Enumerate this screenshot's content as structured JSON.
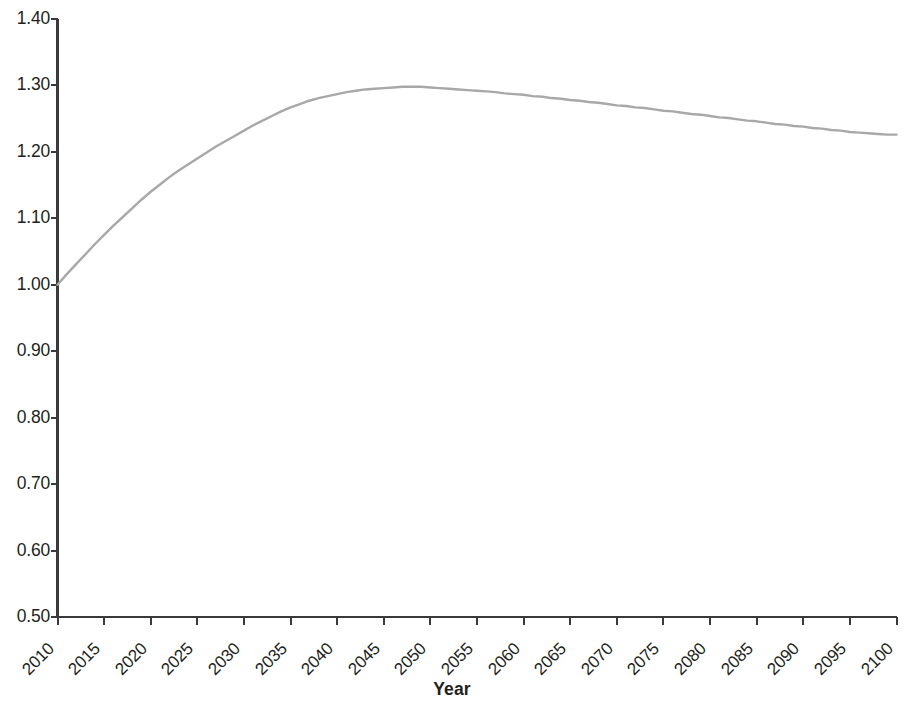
{
  "chart_data": {
    "type": "line",
    "title": "",
    "subtitle": "",
    "xlabel": "Year",
    "ylabel": "",
    "xlim": [
      2010,
      2100
    ],
    "ylim": [
      0.5,
      1.4
    ],
    "ytick_step": 0.1,
    "xtick_step": 5,
    "grid": false,
    "legend": null,
    "legend_position": "none",
    "line_color": "#a8a8a8",
    "axis_color": "#3a3a3a",
    "text_color": "#231f20",
    "background_color": "#ffffff",
    "ytick_labels": [
      "1.40",
      "1.30",
      "1.20",
      "1.10",
      "1.00",
      "0.90",
      "0.80",
      "0.70",
      "0.60",
      "0.50"
    ],
    "ytick_values": [
      1.4,
      1.3,
      1.2,
      1.1,
      1.0,
      0.9,
      0.8,
      0.7,
      0.6,
      0.5
    ],
    "xtick_labels": [
      "2010",
      "2015",
      "2020",
      "2025",
      "2030",
      "2035",
      "2040",
      "2045",
      "2050",
      "2055",
      "2060",
      "2065",
      "2070",
      "2075",
      "2080",
      "2085",
      "2090",
      "2095",
      "2100"
    ],
    "xtick_values": [
      2010,
      2015,
      2020,
      2025,
      2030,
      2035,
      2040,
      2045,
      2050,
      2055,
      2060,
      2065,
      2070,
      2075,
      2080,
      2085,
      2090,
      2095,
      2100
    ],
    "series": [
      {
        "name": "index",
        "x": [
          2010,
          2011,
          2012,
          2013,
          2014,
          2015,
          2016,
          2017,
          2018,
          2019,
          2020,
          2021,
          2022,
          2023,
          2024,
          2025,
          2026,
          2027,
          2028,
          2029,
          2030,
          2031,
          2032,
          2033,
          2034,
          2035,
          2036,
          2037,
          2038,
          2039,
          2040,
          2041,
          2042,
          2043,
          2044,
          2045,
          2046,
          2047,
          2048,
          2049,
          2050,
          2051,
          2052,
          2053,
          2054,
          2055,
          2056,
          2057,
          2058,
          2059,
          2060,
          2061,
          2062,
          2063,
          2064,
          2065,
          2066,
          2067,
          2068,
          2069,
          2070,
          2071,
          2072,
          2073,
          2074,
          2075,
          2076,
          2077,
          2078,
          2079,
          2080,
          2081,
          2082,
          2083,
          2084,
          2085,
          2086,
          2087,
          2088,
          2089,
          2090,
          2091,
          2092,
          2093,
          2094,
          2095,
          2096,
          2097,
          2098,
          2099,
          2100
        ],
        "values": [
          1.0,
          1.016,
          1.031,
          1.046,
          1.061,
          1.075,
          1.089,
          1.102,
          1.115,
          1.128,
          1.14,
          1.151,
          1.162,
          1.172,
          1.181,
          1.19,
          1.199,
          1.208,
          1.216,
          1.224,
          1.232,
          1.24,
          1.247,
          1.254,
          1.261,
          1.267,
          1.272,
          1.277,
          1.281,
          1.284,
          1.287,
          1.29,
          1.292,
          1.294,
          1.295,
          1.296,
          1.297,
          1.298,
          1.298,
          1.298,
          1.297,
          1.296,
          1.295,
          1.294,
          1.293,
          1.292,
          1.291,
          1.29,
          1.288,
          1.287,
          1.286,
          1.284,
          1.283,
          1.281,
          1.28,
          1.278,
          1.277,
          1.275,
          1.274,
          1.272,
          1.27,
          1.269,
          1.267,
          1.266,
          1.264,
          1.262,
          1.261,
          1.259,
          1.257,
          1.256,
          1.254,
          1.252,
          1.251,
          1.249,
          1.247,
          1.246,
          1.244,
          1.242,
          1.241,
          1.239,
          1.238,
          1.236,
          1.235,
          1.233,
          1.232,
          1.23,
          1.229,
          1.228,
          1.227,
          1.226,
          1.226
        ]
      }
    ],
    "annotations": []
  },
  "axis": {
    "x_title": "Year"
  }
}
